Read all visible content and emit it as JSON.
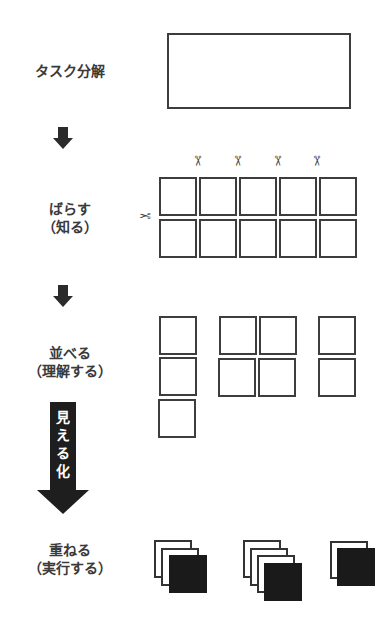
{
  "steps": {
    "decompose": {
      "label": "タスク分解"
    },
    "split": {
      "line1": "ばらす",
      "line2": "（知る）"
    },
    "arrange": {
      "line1": "並べる",
      "line2": "（理解する）"
    },
    "stack": {
      "line1": "重ねる",
      "line2": "（実行する）"
    }
  },
  "visualize_arrow": {
    "chars": [
      "見",
      "え",
      "る",
      "化"
    ]
  },
  "icons": {
    "scissors": "✂",
    "arrow_down": "down-arrow"
  },
  "grid": {
    "rows": 2,
    "cols": 5
  },
  "groups": {
    "arrange": [
      {
        "cols": 1,
        "rows": 3
      },
      {
        "cols": 2,
        "rows": 2
      },
      {
        "cols": 1,
        "rows": 2
      }
    ],
    "stack": [
      {
        "sheets": 3
      },
      {
        "sheets": 4
      },
      {
        "sheets": 2
      }
    ]
  },
  "colors": {
    "stroke": "#3d3d3d",
    "fill_dark": "#1a1a1a",
    "text": "#3a3a3a"
  }
}
